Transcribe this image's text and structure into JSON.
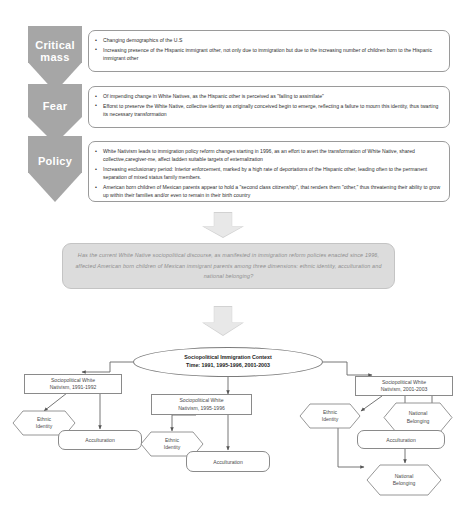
{
  "top_section": {
    "stages": [
      {
        "label": "Critical mass",
        "label_line1": "Critical",
        "label_line2": "mass",
        "bullets": [
          "Changing demographics of the U.S",
          "Increasing presence of the Hispanic immigrant other, not only due to immigration but due to the increasing number of children born to the Hispanic immigrant other"
        ]
      },
      {
        "label": "Fear",
        "label_line1": "Fear",
        "label_line2": "",
        "bullets": [
          "Of impending change in White Natives, as the Hispanic other is perceived as \"failing to assimilate\"",
          "Efforst to preserve the White Native, collective identity as originally conceived begin to emerge, reflecting a failure to mourn this identity, thus twarting its necessary transformation"
        ]
      },
      {
        "label": "Policy",
        "label_line1": "Policy",
        "label_line2": "",
        "bullets": [
          "White Nativism leads to immigration policy reform changes starting in 1996, as an effort to avert the transformation of White Native, shared collective,caregiver-me, affect ladden suitable targets of externalization",
          "Increasing exclusionary period: Interior enforcement, marked by a high rate of deportations of the Hispanic other, leading often to the permanent separation of  mixed status family members.",
          "American born children of Mexican parents appear to hold a \"second class citizenship\", that renders them \"other,\" thus threatening their ability to grow up within their families and/or even to remain in their birth country"
        ]
      }
    ]
  },
  "research_question": {
    "text": "Has the current White Native sociopolitical discourse, as manifested in immigration reform policies enacted since 1996, affected American born children of Mexican immigrant parents among three dimensions: ethnic identity, acculturation and national belonging?"
  },
  "flowchart": {
    "context": {
      "line1": "Sociopolitical Immigration Context",
      "line2": "Time: 1991, 1995-1996, 2001-2003"
    },
    "branches": [
      {
        "title_line1": "Sociopolitical White",
        "title_line2": "Nativism, 1991-1992",
        "nodes": [
          {
            "label_line1": "Ethnic",
            "label_line2": "Identity",
            "shape": "hexagon"
          },
          {
            "label_line1": "Acculturation",
            "label_line2": "",
            "shape": "rounded"
          }
        ]
      },
      {
        "title_line1": "Sociopolitical White",
        "title_line2": "Nativism, 1995-1996",
        "nodes": [
          {
            "label_line1": "Ethnic",
            "label_line2": "Identity",
            "shape": "hexagon"
          },
          {
            "label_line1": "Acculturation",
            "label_line2": "",
            "shape": "rounded"
          }
        ]
      },
      {
        "title_line1": "Sociopolitical White",
        "title_line2": "Nativism, 2001-2003",
        "nodes": [
          {
            "label_line1": "Ethnic",
            "label_line2": "Identity",
            "shape": "hexagon"
          },
          {
            "label_line1": "National",
            "label_line2": "Belonging",
            "shape": "hexagon"
          },
          {
            "label_line1": "Acculturation",
            "label_line2": "",
            "shape": "rounded"
          },
          {
            "label_line1": "National",
            "label_line2": "Belonging",
            "shape": "hexagon"
          }
        ]
      }
    ]
  },
  "colors": {
    "chevron": "#a6a6a6",
    "arrow": "#d2d2d2",
    "question_bg": "#dcdcdc",
    "line": "#6f6f6f"
  }
}
